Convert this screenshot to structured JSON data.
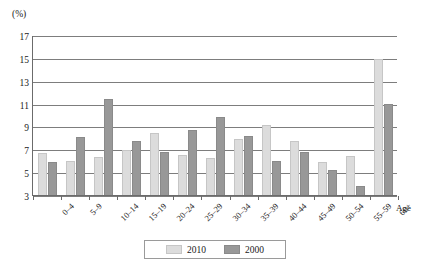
{
  "chart_data": {
    "type": "bar",
    "title": "",
    "subtitle": "",
    "xlabel": "Age",
    "ylabel": "(%)",
    "ylim": [
      3,
      17
    ],
    "ytick_step": 2,
    "yticks": [
      17,
      15,
      13,
      11,
      9,
      7,
      5,
      3
    ],
    "grid": true,
    "legend_position": "bottom-center",
    "categories": [
      "0–4",
      "5–9",
      "10–14",
      "15–19",
      "20–24",
      "25–29",
      "30–34",
      "35–39",
      "40–44",
      "45–49",
      "50–54",
      "55–59",
      "60+"
    ],
    "series": [
      {
        "name": "2010",
        "color": "#dcdcdc",
        "values": [
          6.7,
          6.0,
          6.3,
          6.9,
          8.4,
          6.5,
          6.2,
          7.9,
          9.1,
          7.7,
          5.9,
          6.4,
          14.9
        ]
      },
      {
        "name": "2000",
        "color": "#989898",
        "values": [
          5.9,
          8.1,
          11.4,
          7.7,
          6.8,
          8.7,
          9.8,
          8.2,
          6.0,
          6.8,
          5.2,
          3.8,
          11.0
        ]
      }
    ]
  },
  "axes": {
    "y_unit_label": "(%)",
    "x_axis_title": "Age"
  },
  "legend": {
    "entries": [
      {
        "label": "2010"
      },
      {
        "label": "2000"
      }
    ]
  },
  "colors": {
    "series_2010": "#dcdcdc",
    "series_2000": "#989898",
    "gridline": "#7d7d7d",
    "axis": "#6b6b6b",
    "text": "#1a1a1a",
    "background": "#ffffff"
  }
}
